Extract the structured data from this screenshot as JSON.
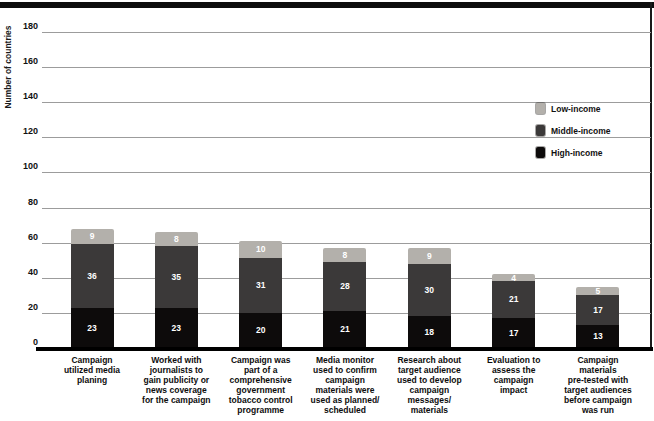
{
  "chart_data": {
    "type": "bar",
    "stacked": true,
    "title": "",
    "ylabel": "Number of countries",
    "xlabel": "",
    "ylim": [
      0,
      180
    ],
    "ytick_step": 20,
    "grid": true,
    "legend_position": "right",
    "categories": [
      "Campaign\nutilized media\nplaning",
      "Worked with\njournalists to\ngain publicity or\nnews coverage\nfor the campaign",
      "Campaign was\npart of a\ncomprehensive\ngovernment\ntobacco control\nprogramme",
      "Media monitor\nused to confirm\ncampaign\nmaterials were\nused as planned/\nscheduled",
      "Research about\ntarget audience\nused to develop\ncampaign\nmessages/\nmaterials",
      "Evaluation to\nassess the\ncampaign\nimpact",
      "Campaign\nmaterials\npre-tested with\ntarget audiences\nbefore campaign\nwas run"
    ],
    "series": [
      {
        "name": "High-income",
        "color": "#0d0b0b",
        "values": [
          23,
          23,
          20,
          21,
          18,
          17,
          13
        ]
      },
      {
        "name": "Middle-income",
        "color": "#3b3939",
        "values": [
          36,
          35,
          31,
          28,
          30,
          21,
          17
        ]
      },
      {
        "name": "Low-income",
        "color": "#b3b0ab",
        "values": [
          9,
          8,
          10,
          8,
          9,
          4,
          5
        ]
      }
    ],
    "legend_entries": [
      {
        "label": "Low-income",
        "color": "#b3b0ab"
      },
      {
        "label": "Middle-income",
        "color": "#3b3939"
      },
      {
        "label": "High-income",
        "color": "#0d0b0b"
      }
    ]
  },
  "style": {
    "gridline_color": "#9c9c9c",
    "axis_color": "#000000",
    "bar_value_text_color": "#ffffff",
    "top_rule_color": "#0d0d0d"
  }
}
